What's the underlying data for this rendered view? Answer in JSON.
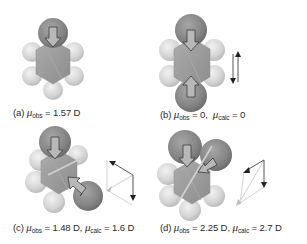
{
  "figure": {
    "panels": [
      {
        "id": "a",
        "label": "(a)",
        "molecule": "chlorobenzene",
        "caption_parts": [
          {
            "text": "(a) "
          },
          {
            "symbol": "μ",
            "sub": "obs"
          },
          {
            "text": " = 1.57 D"
          }
        ],
        "mu_obs": "1.57 D",
        "vector_diagram": false
      },
      {
        "id": "b",
        "label": "(b)",
        "molecule": "p-dichlorobenzene",
        "caption_parts": [
          {
            "text": "(b) "
          },
          {
            "symbol": "μ",
            "sub": "obs"
          },
          {
            "text": " = 0,  "
          },
          {
            "symbol": "μ",
            "sub": "calc"
          },
          {
            "text": " = 0"
          }
        ],
        "mu_obs": "0",
        "mu_calc": "0",
        "vector_diagram": "antiparallel"
      },
      {
        "id": "c",
        "label": "(c)",
        "molecule": "m-dichlorobenzene",
        "caption_parts": [
          {
            "text": "(c) "
          },
          {
            "symbol": "μ",
            "sub": "obs"
          },
          {
            "text": " = 1.48 D, "
          },
          {
            "symbol": "μ",
            "sub": "calc"
          },
          {
            "text": " = 1.6 D"
          }
        ],
        "mu_obs": "1.48 D",
        "mu_calc": "1.6 D",
        "vector_diagram": "parallelogram-120"
      },
      {
        "id": "d",
        "label": "(d)",
        "molecule": "o-dichlorobenzene",
        "caption_parts": [
          {
            "text": "(d) "
          },
          {
            "symbol": "μ",
            "sub": "obs"
          },
          {
            "text": " = 2.25 D, "
          },
          {
            "symbol": "μ",
            "sub": "calc"
          },
          {
            "text": " = 2.7 D"
          }
        ],
        "mu_obs": "2.25 D",
        "mu_calc": "2.7 D",
        "vector_diagram": "parallelogram-60"
      }
    ],
    "colors": {
      "chlorine": "#8a8a8a",
      "carbon": "#9a9a9a",
      "hydrogen": "#d8d8d8",
      "arrow_fill": "#b4b4b4",
      "arrow_stroke": "#3c3c3c",
      "resultant": "#c8c8c8",
      "text": "#2a2a2a"
    }
  }
}
